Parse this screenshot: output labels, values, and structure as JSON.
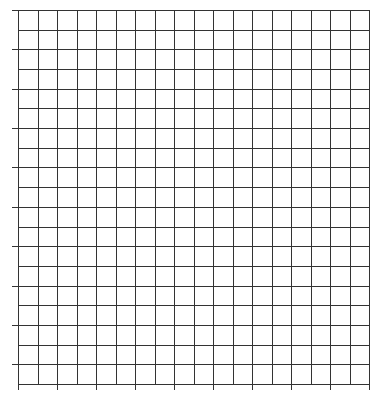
{
  "chart_data": {
    "type": "line",
    "title": "",
    "xlabel": "",
    "ylabel": "",
    "series": [],
    "grid": true,
    "grid_columns": 18,
    "grid_rows": 19,
    "x_ticks_labels": [],
    "y_ticks_labels": [],
    "legend": null
  },
  "style": {
    "line_color": "#333333",
    "background": "#ffffff"
  }
}
